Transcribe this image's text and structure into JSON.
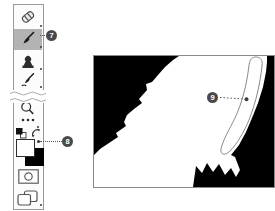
{
  "callouts": [
    {
      "number": "7"
    },
    {
      "number": "8"
    },
    {
      "number": "9"
    }
  ],
  "toolbar": {
    "tools": [
      {
        "name": "spot-healing-brush",
        "selected": false
      },
      {
        "name": "brush",
        "selected": true
      },
      {
        "name": "clone-stamp",
        "selected": false
      },
      {
        "name": "history-brush",
        "selected": false
      },
      {
        "name": "zoom",
        "selected": false
      },
      {
        "name": "edit-toolbar",
        "selected": false
      },
      {
        "name": "default-colors",
        "selected": false
      },
      {
        "name": "swap-colors",
        "selected": false
      },
      {
        "name": "quick-mask-mode",
        "selected": false
      },
      {
        "name": "screen-mode",
        "selected": false
      }
    ],
    "foreground_color": "#ffffff",
    "background_color": "#000000",
    "selected_tool_background": "#b3b3b3"
  },
  "canvas": {
    "type": "layer-mask-preview",
    "mask_black": "#000000",
    "mask_white": "#ffffff",
    "annotation": "outlined painted stroke region"
  },
  "colors": {
    "callout_background": "#4a4a4a",
    "callout_text": "#ffffff",
    "leader_line": "#5a5a5a",
    "panel_border": "#9a9a9a"
  }
}
